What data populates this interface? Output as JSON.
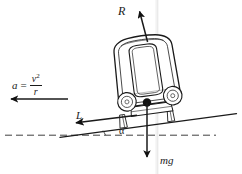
{
  "figure": {
    "type": "physics-force-diagram"
  },
  "labels": {
    "reaction": "R",
    "weight": "mg",
    "lateral": "L",
    "angle": "α",
    "accel_symbol": "a",
    "accel_equals": "=",
    "accel_numerator": "v",
    "accel_numerator_exponent": "2",
    "accel_denominator": "r"
  },
  "vectors": [
    {
      "name": "reaction-force",
      "label": "R",
      "description": "normal reaction, perpendicular to banked track surface",
      "from": [
        147,
        41
      ],
      "to": [
        139,
        9
      ],
      "direction": "up-left"
    },
    {
      "name": "weight-force",
      "label": "mg",
      "description": "gravitational weight acting vertically downward from centre of mass",
      "from": [
        147,
        103
      ],
      "to": [
        147,
        160
      ],
      "direction": "down"
    },
    {
      "name": "lateral-force",
      "label": "L",
      "description": "lateral force component along the inclined track surface",
      "from": [
        136,
        116
      ],
      "to": [
        73,
        124
      ],
      "direction": "down-left"
    },
    {
      "name": "centripetal-acceleration",
      "label": "a = v²/r",
      "description": "centripetal acceleration directed horizontally toward curve centre",
      "from": [
        68,
        99
      ],
      "to": [
        9,
        99
      ],
      "direction": "left"
    }
  ],
  "geometry": {
    "incline_line": {
      "name": "track-surface-line",
      "from": [
        60,
        137
      ],
      "to": [
        236,
        114
      ]
    },
    "horizontal_reference": {
      "name": "horizontal-dashed-line",
      "from": [
        5,
        135
      ],
      "to": [
        216,
        135
      ],
      "style": "dashed"
    },
    "bank_angle": {
      "name": "bank-angle-alpha",
      "label": "α",
      "vertex": [
        60,
        137
      ]
    }
  },
  "vehicle": {
    "name": "railway-carriage",
    "parts": [
      {
        "name": "carriage-body",
        "description": "rounded rectangular car body, front view"
      },
      {
        "name": "carriage-window",
        "description": "large rounded window panel on cab front"
      },
      {
        "name": "wheel-left",
        "description": "left wheel with hub"
      },
      {
        "name": "wheel-right",
        "description": "right wheel with hub"
      },
      {
        "name": "chassis-frame",
        "description": "undercarriage frame between wheels"
      },
      {
        "name": "centre-of-mass",
        "description": "filled dot marking centre of mass"
      }
    ]
  },
  "colors": {
    "stroke": "#1a1a1a",
    "arrow_fill": "#111111",
    "body_fill": "#ffffff",
    "background": "#ffffff",
    "watermark": "#f0f0f0"
  }
}
